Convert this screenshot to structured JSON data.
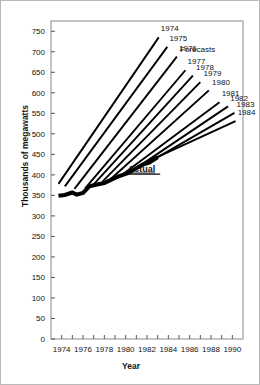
{
  "chart_data": {
    "type": "line",
    "title": "",
    "xlabel": "Year",
    "ylabel": "Thousands of megawatts",
    "xlim": [
      1973,
      1991
    ],
    "ylim": [
      0,
      775
    ],
    "yticks": [
      0,
      50,
      100,
      150,
      200,
      250,
      300,
      350,
      400,
      450,
      500,
      550,
      600,
      650,
      700,
      750
    ],
    "xticks": [
      1974,
      1975,
      1976,
      1977,
      1978,
      1979,
      1980,
      1981,
      1982,
      1983,
      1984,
      1985,
      1986,
      1987,
      1988,
      1989,
      1990
    ],
    "xtick_labels": [
      "1974",
      "",
      "1976",
      "",
      "1978",
      "",
      "1980",
      "",
      "1982",
      "",
      "1984",
      "",
      "1986",
      "",
      "1988",
      "",
      "1990"
    ],
    "grid": false,
    "legend_position": "none",
    "annotations": [
      {
        "text": "Forecasts",
        "x": 1985.1,
        "y": 700
      },
      {
        "text": "Actual",
        "x": 1980.2,
        "y": 408,
        "underline": true,
        "bold": true
      }
    ],
    "series": [
      {
        "name": "Actual",
        "kind": "actual",
        "label": "Actual",
        "x": [
          1973.7,
          1974.3,
          1975.0,
          1975.4,
          1976.0,
          1976.6,
          1977.2,
          1978.0,
          1978.7,
          1979.4,
          1980.2,
          1981.0,
          1981.6,
          1982.2,
          1983.0
        ],
        "y": [
          349,
          351,
          357,
          352,
          356,
          372,
          376,
          380,
          389,
          397,
          404,
          416,
          425,
          430,
          443
        ]
      },
      {
        "name": "1974",
        "kind": "forecast",
        "label": "1974",
        "x": [
          1973.7,
          1983.1
        ],
        "y": [
          378,
          735
        ]
      },
      {
        "name": "1975",
        "kind": "forecast",
        "label": "1975",
        "x": [
          1974.3,
          1983.9
        ],
        "y": [
          372,
          712
        ]
      },
      {
        "name": "1976",
        "kind": "forecast",
        "label": "1976",
        "x": [
          1975.2,
          1984.8
        ],
        "y": [
          366,
          688
        ]
      },
      {
        "name": "1977",
        "kind": "forecast",
        "label": "1977",
        "x": [
          1976.2,
          1985.6
        ],
        "y": [
          367,
          655
        ]
      },
      {
        "name": "1978",
        "kind": "forecast",
        "label": "1978",
        "x": [
          1977.0,
          1986.3
        ],
        "y": [
          377,
          642
        ]
      },
      {
        "name": "1979",
        "kind": "forecast",
        "label": "1979",
        "x": [
          1977.8,
          1987.0
        ],
        "y": [
          383,
          626
        ]
      },
      {
        "name": "1980",
        "kind": "forecast",
        "label": "1980",
        "x": [
          1978.6,
          1987.8
        ],
        "y": [
          390,
          606
        ]
      },
      {
        "name": "1981",
        "kind": "forecast",
        "label": "1981",
        "x": [
          1979.6,
          1988.8
        ],
        "y": [
          399,
          577
        ]
      },
      {
        "name": "1982",
        "kind": "forecast",
        "label": "1982",
        "x": [
          1980.4,
          1989.6
        ],
        "y": [
          406,
          567
        ]
      },
      {
        "name": "1983",
        "kind": "forecast",
        "label": "1983",
        "x": [
          1981.6,
          1990.2
        ],
        "y": [
          422,
          551
        ]
      },
      {
        "name": "1984",
        "kind": "forecast",
        "label": "1984",
        "x": [
          1982.7,
          1990.3
        ],
        "y": [
          440,
          531
        ]
      }
    ],
    "forecast_label_positions": [
      {
        "label": "1974",
        "x": 1983.3,
        "y": 750
      },
      {
        "label": "1975",
        "x": 1984.1,
        "y": 726
      },
      {
        "label": "1976",
        "x": 1985.0,
        "y": 702
      },
      {
        "label": "1977",
        "x": 1985.8,
        "y": 669
      },
      {
        "label": "1978",
        "x": 1986.6,
        "y": 656
      },
      {
        "label": "1979",
        "x": 1987.3,
        "y": 640
      },
      {
        "label": "1980",
        "x": 1988.1,
        "y": 620
      },
      {
        "label": "1981",
        "x": 1989.0,
        "y": 591
      },
      {
        "label": "1982",
        "x": 1989.8,
        "y": 581
      },
      {
        "label": "1983",
        "x": 1990.4,
        "y": 565
      },
      {
        "label": "1984",
        "x": 1990.5,
        "y": 545
      }
    ]
  },
  "axes": {
    "ylabel": "Thousands of megawatts",
    "xlabel": "Year"
  }
}
